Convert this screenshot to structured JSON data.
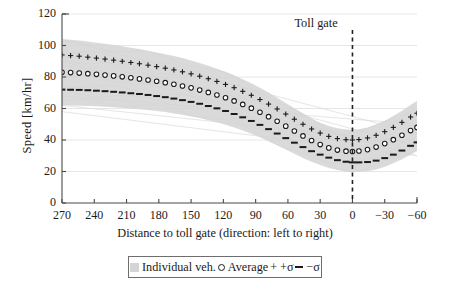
{
  "chart_data": {
    "type": "line",
    "title": "",
    "xlabel": "Distance to toll gate (direction: left to right)",
    "ylabel": "Speed [km/hr]",
    "xlim": [
      270,
      -60
    ],
    "ylim": [
      0,
      120
    ],
    "x_ticks": [
      270,
      240,
      210,
      180,
      150,
      120,
      90,
      60,
      30,
      0,
      -30,
      -60
    ],
    "x_tick_labels": [
      "270",
      "240",
      "210",
      "180",
      "150",
      "120",
      "90",
      "60",
      "30",
      "0",
      "−30",
      "−60"
    ],
    "y_ticks": [
      0,
      20,
      40,
      60,
      80,
      100,
      120
    ],
    "y_tick_labels": [
      "0",
      "20",
      "40",
      "60",
      "80",
      "100",
      "120"
    ],
    "grid": "horizontal",
    "x_axis_reversed": true,
    "annotations": [
      {
        "name": "toll-gate-marker",
        "label": "Toll gate",
        "x": 0,
        "style": "vertical dashed line"
      }
    ],
    "legend": {
      "position": "below-axes",
      "entries": [
        {
          "label": "Individual veh.",
          "marker": "gray-band",
          "color": "#d4d4d4"
        },
        {
          "label": "Average",
          "marker": "open-circle",
          "color": "#1a1a1a"
        },
        {
          "label": "+σ",
          "marker": "plus",
          "color": "#1a1a1a"
        },
        {
          "label": "−σ",
          "marker": "dash",
          "color": "#1a1a1a"
        }
      ]
    },
    "x": [
      270,
      262,
      254,
      246,
      238,
      230,
      222,
      214,
      206,
      198,
      190,
      182,
      174,
      166,
      158,
      150,
      142,
      134,
      126,
      118,
      110,
      102,
      94,
      86,
      78,
      70,
      62,
      54,
      46,
      38,
      30,
      22,
      14,
      6,
      0,
      -6,
      -14,
      -22,
      -30,
      -38,
      -46,
      -54,
      -60
    ],
    "series": [
      {
        "name": "+σ",
        "marker": "plus",
        "values": [
          94.0,
          93.6,
          93.2,
          92.6,
          92.0,
          91.4,
          90.7,
          90.0,
          89.2,
          88.4,
          87.5,
          86.6,
          85.6,
          84.5,
          83.3,
          82.0,
          80.5,
          78.9,
          77.2,
          75.3,
          73.2,
          70.9,
          68.4,
          65.7,
          62.8,
          59.7,
          56.5,
          53.2,
          50.0,
          47.0,
          44.4,
          42.3,
          40.9,
          40.2,
          40.0,
          40.3,
          41.3,
          43.0,
          45.3,
          48.0,
          51.2,
          54.6,
          57.0
        ]
      },
      {
        "name": "Average",
        "marker": "open-circle",
        "values": [
          83.0,
          82.8,
          82.5,
          82.1,
          81.7,
          81.2,
          80.7,
          80.1,
          79.5,
          78.8,
          78.1,
          77.3,
          76.4,
          75.4,
          74.3,
          73.1,
          71.7,
          70.2,
          68.6,
          66.8,
          64.8,
          62.6,
          60.2,
          57.6,
          54.8,
          51.9,
          48.8,
          45.7,
          42.6,
          39.7,
          37.1,
          35.0,
          33.6,
          32.9,
          32.7,
          33.0,
          33.9,
          35.5,
          37.7,
          40.2,
          43.0,
          46.0,
          48.0
        ]
      },
      {
        "name": "−σ",
        "marker": "dash",
        "values": [
          72.0,
          71.9,
          71.8,
          71.6,
          71.3,
          71.0,
          70.6,
          70.2,
          69.7,
          69.2,
          68.6,
          67.9,
          67.2,
          66.3,
          65.3,
          64.2,
          63.0,
          61.6,
          60.1,
          58.4,
          56.5,
          54.4,
          52.1,
          49.6,
          46.9,
          44.1,
          41.2,
          38.3,
          35.5,
          32.9,
          30.7,
          28.8,
          27.2,
          26.2,
          25.8,
          25.8,
          26.0,
          26.9,
          28.5,
          30.7,
          33.3,
          36.3,
          38.5
        ]
      }
    ],
    "individual_band": {
      "name": "Individual veh.",
      "color": "#d4d4d4",
      "upper": [
        104.0,
        103.6,
        103.1,
        102.5,
        101.8,
        101.1,
        100.3,
        99.5,
        98.6,
        97.7,
        96.7,
        95.6,
        94.5,
        93.3,
        92.0,
        90.5,
        88.9,
        87.2,
        85.3,
        83.3,
        81.1,
        78.6,
        76.0,
        73.1,
        70.1,
        66.9,
        63.5,
        60.1,
        56.8,
        53.7,
        51.0,
        48.9,
        47.4,
        46.7,
        46.5,
        46.8,
        47.9,
        49.8,
        52.3,
        55.2,
        58.6,
        62.3,
        65.0
      ],
      "lower": [
        62.0,
        61.9,
        61.8,
        61.6,
        61.4,
        61.1,
        60.8,
        60.4,
        60.0,
        59.5,
        59.0,
        58.4,
        57.7,
        56.9,
        56.0,
        55.0,
        53.9,
        52.6,
        51.2,
        49.7,
        48.0,
        46.1,
        44.0,
        41.7,
        39.2,
        36.6,
        33.9,
        31.2,
        28.6,
        26.2,
        24.1,
        22.3,
        20.9,
        20.0,
        19.7,
        19.8,
        20.2,
        21.3,
        23.0,
        25.2,
        27.8,
        30.7,
        33.0
      ]
    },
    "individual_traces": [
      {
        "start": 101.0,
        "slope_shape": "declining",
        "offset": 0.0
      },
      {
        "start": 96.0,
        "slope_shape": "declining",
        "offset": -5.0
      },
      {
        "start": 91.0,
        "slope_shape": "declining",
        "offset": -10.0
      },
      {
        "start": 86.0,
        "slope_shape": "declining",
        "offset": -15.0
      },
      {
        "start": 81.0,
        "slope_shape": "declining",
        "offset": -20.0
      },
      {
        "start": 76.0,
        "slope_shape": "declining",
        "offset": -25.0
      },
      {
        "start": 71.0,
        "slope_shape": "declining",
        "offset": -30.0
      },
      {
        "start": 66.0,
        "slope_shape": "declining",
        "offset": -35.0
      }
    ]
  },
  "figure": {
    "toll_gate_label": "Toll gate",
    "colors": {
      "axis": "#4a4a4a",
      "grid": "#e3e3e3",
      "series": "#1a1a1a",
      "band": "#d4d4d4"
    }
  }
}
